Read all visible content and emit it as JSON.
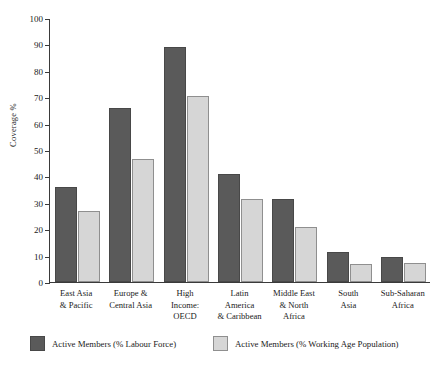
{
  "chart_data": {
    "type": "bar",
    "title": "",
    "subtitle": "",
    "xlabel": "",
    "ylabel": "Coverage %",
    "ylim": [
      0,
      100
    ],
    "yticks": [
      0,
      10,
      20,
      30,
      40,
      50,
      60,
      70,
      80,
      90,
      100
    ],
    "grid": false,
    "legend_position": "bottom",
    "orientation": "vertical",
    "grouping": "grouped",
    "categories": [
      "East Asia\n& Pacific",
      "Europe &\nCentral Asia",
      "High\nIncome:\nOECD",
      "Latin\nAmerica\n& Caribbean",
      "Middle East\n& North\nAfrica",
      "South\nAsia",
      "Sub-Saharan\nAfrica"
    ],
    "category_lines": [
      [
        "East Asia",
        "& Pacific"
      ],
      [
        "Europe &",
        "Central Asia"
      ],
      [
        "High",
        "Income:",
        "OECD"
      ],
      [
        "Latin",
        "America",
        "& Caribbean"
      ],
      [
        "Middle East",
        "& North",
        "Africa"
      ],
      [
        "South",
        "Asia"
      ],
      [
        "Sub-Saharan",
        "Africa"
      ]
    ],
    "series": [
      {
        "name": "Active Members (% Labour Force)",
        "color": "#5a5a5a",
        "values": [
          36.0,
          66.0,
          89.0,
          41.0,
          31.5,
          11.5,
          9.5
        ]
      },
      {
        "name": "Active Members (% Working Age Population)",
        "color": "#d6d6d6",
        "values": [
          27.0,
          46.5,
          70.5,
          31.5,
          20.7,
          7.0,
          7.3
        ]
      }
    ]
  }
}
